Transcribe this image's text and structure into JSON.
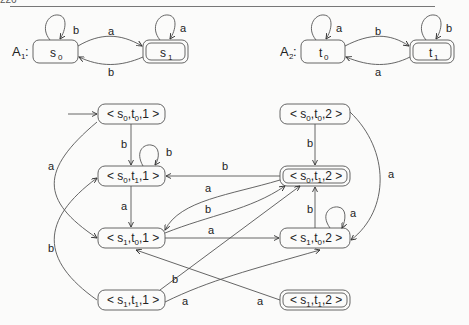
{
  "page": {
    "number": "226"
  },
  "automata": [
    {
      "name": "A",
      "sub": "1",
      "states": [
        {
          "id": "s0",
          "base": "s",
          "sub": "0",
          "accepting": false
        },
        {
          "id": "s1",
          "base": "s",
          "sub": "1",
          "accepting": true
        }
      ],
      "edges": [
        {
          "from": "s0",
          "to": "s0",
          "label": "b"
        },
        {
          "from": "s1",
          "to": "s1",
          "label": "a"
        },
        {
          "from": "s0",
          "to": "s1",
          "label": "a"
        },
        {
          "from": "s1",
          "to": "s0",
          "label": "b"
        }
      ]
    },
    {
      "name": "A",
      "sub": "2",
      "states": [
        {
          "id": "t0",
          "base": "t",
          "sub": "0",
          "accepting": false
        },
        {
          "id": "t1",
          "base": "t",
          "sub": "1",
          "accepting": true
        }
      ],
      "edges": [
        {
          "from": "t0",
          "to": "t0",
          "label": "a"
        },
        {
          "from": "t1",
          "to": "t1",
          "label": "b"
        },
        {
          "from": "t0",
          "to": "t1",
          "label": "b"
        },
        {
          "from": "t1",
          "to": "t0",
          "label": "a"
        }
      ]
    }
  ],
  "product": {
    "nodes": [
      {
        "id": "s0t0_1",
        "s": "0",
        "t": "0",
        "k": "1",
        "accepting": false,
        "initial": true
      },
      {
        "id": "s0t1_1",
        "s": "0",
        "t": "1",
        "k": "1",
        "accepting": false
      },
      {
        "id": "s1t0_1",
        "s": "1",
        "t": "0",
        "k": "1",
        "accepting": false
      },
      {
        "id": "s1t1_1",
        "s": "1",
        "t": "1",
        "k": "1",
        "accepting": false
      },
      {
        "id": "s0t0_2",
        "s": "0",
        "t": "0",
        "k": "2",
        "accepting": false
      },
      {
        "id": "s0t1_2",
        "s": "0",
        "t": "1",
        "k": "2",
        "accepting": true
      },
      {
        "id": "s1t0_2",
        "s": "1",
        "t": "0",
        "k": "2",
        "accepting": false
      },
      {
        "id": "s1t1_2",
        "s": "1",
        "t": "1",
        "k": "2",
        "accepting": true
      }
    ],
    "edges": [
      {
        "from": "s0t0_1",
        "to": "s0t1_1",
        "label": "b"
      },
      {
        "from": "s0t1_1",
        "to": "s0t1_1",
        "label": "b"
      },
      {
        "from": "s0t1_1",
        "to": "s1t0_1",
        "label": "a"
      },
      {
        "from": "s0t0_1",
        "to": "s1t0_1",
        "label": "a"
      },
      {
        "from": "s1t1_1",
        "to": "s0t1_1",
        "label": "b"
      },
      {
        "from": "s0t1_2",
        "to": "s0t1_1",
        "label": "b"
      },
      {
        "from": "s0t1_2",
        "to": "s1t0_1",
        "label": "a"
      },
      {
        "from": "s1t0_1",
        "to": "s0t1_2",
        "label": "b"
      },
      {
        "from": "s1t0_1",
        "to": "s1t0_2",
        "label": "a"
      },
      {
        "from": "s0t0_2",
        "to": "s0t1_2",
        "label": "b"
      },
      {
        "from": "s0t0_2",
        "to": "s1t0_2",
        "label": "a"
      },
      {
        "from": "s1t0_2",
        "to": "s1t0_2",
        "label": "a"
      },
      {
        "from": "s1t0_2",
        "to": "s0t1_2",
        "label": "b"
      },
      {
        "from": "s1t1_1",
        "to": "s0t1_2",
        "label": "b"
      },
      {
        "from": "s1t1_1",
        "to": "s1t0_2",
        "label": "a"
      },
      {
        "from": "s1t1_2",
        "to": "s1t0_1",
        "label": "a"
      }
    ]
  },
  "labels": {
    "a": "a",
    "b": "b",
    "lt": "<",
    "gt": ">",
    "comma": ","
  }
}
